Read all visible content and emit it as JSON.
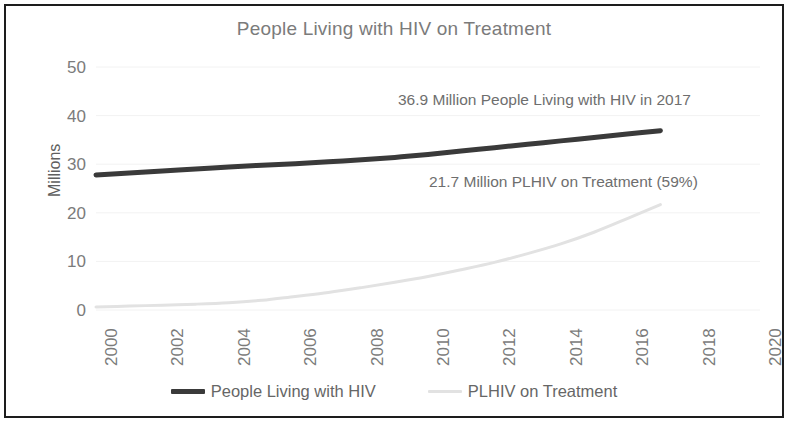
{
  "chart_data": {
    "type": "line",
    "title": "People Living with HIV on Treatment",
    "xlabel": "",
    "ylabel": "Millions",
    "xlim": [
      2000,
      2020
    ],
    "ylim": [
      0,
      50
    ],
    "grid": true,
    "legend_position": "bottom",
    "x_ticks": [
      "2000",
      "2002",
      "2004",
      "2006",
      "2008",
      "2010",
      "2012",
      "2014",
      "2016",
      "2018",
      "2020"
    ],
    "y_ticks": [
      "0",
      "10",
      "20",
      "30",
      "40",
      "50"
    ],
    "x": [
      2000,
      2001,
      2002,
      2003,
      2004,
      2005,
      2006,
      2007,
      2008,
      2009,
      2010,
      2011,
      2012,
      2013,
      2014,
      2015,
      2016,
      2017
    ],
    "series": [
      {
        "name": "People Living with HIV",
        "color": "#3a3a3a",
        "values": [
          27.8,
          28.2,
          28.6,
          29.0,
          29.4,
          29.8,
          30.1,
          30.5,
          30.9,
          31.4,
          32.0,
          32.7,
          33.4,
          34.1,
          34.8,
          35.5,
          36.2,
          36.9
        ]
      },
      {
        "name": "PLHIV on Treatment",
        "color": "#e2e2e2",
        "values": [
          0.6,
          0.8,
          1.0,
          1.2,
          1.5,
          2.0,
          2.8,
          3.6,
          4.6,
          5.7,
          6.9,
          8.3,
          9.8,
          11.6,
          13.6,
          16.0,
          18.8,
          21.7
        ]
      }
    ],
    "annotations": [
      "36.9 Million People Living with HIV in 2017",
      "21.7 Million PLHIV on Treatment (59%)"
    ]
  }
}
